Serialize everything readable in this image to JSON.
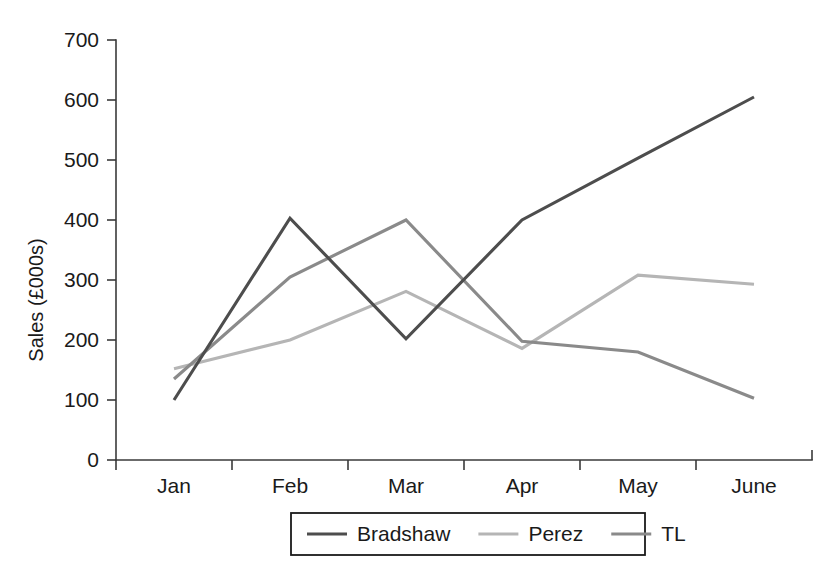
{
  "chart_data": {
    "type": "line",
    "title": "",
    "xlabel": "",
    "ylabel": "Sales (£000s)",
    "categories": [
      "Jan",
      "Feb",
      "Mar",
      "Apr",
      "May",
      "June"
    ],
    "ylim": [
      0,
      700
    ],
    "yticks": [
      0,
      100,
      200,
      300,
      400,
      500,
      600,
      700
    ],
    "ytick_labels": [
      "0",
      "100",
      "200",
      "300",
      "400",
      "500",
      "600",
      "700"
    ],
    "grid": false,
    "legend_position": "bottom",
    "series": [
      {
        "name": "Bradshaw",
        "color": "#4d4d4d",
        "values": [
          100,
          403,
          202,
          400,
          503,
          605
        ]
      },
      {
        "name": "Perez",
        "color": "#b5b5b5",
        "values": [
          152,
          200,
          281,
          186,
          308,
          293
        ]
      },
      {
        "name": "TL",
        "color": "#8a8a8a",
        "values": [
          135,
          305,
          400,
          198,
          180,
          103
        ]
      }
    ]
  },
  "legend": {
    "entries": [
      {
        "label": "Bradshaw",
        "color": "#4d4d4d"
      },
      {
        "label": "Perez",
        "color": "#b5b5b5"
      },
      {
        "label": "TL",
        "color": "#8a8a8a"
      }
    ]
  },
  "axes": {
    "y_axis_title": "Sales (£000s)",
    "y_tick_labels": [
      "700",
      "600",
      "500",
      "400",
      "300",
      "200",
      "100",
      "0"
    ],
    "x_tick_labels": [
      "Jan",
      "Feb",
      "Mar",
      "Apr",
      "May",
      "June"
    ]
  }
}
